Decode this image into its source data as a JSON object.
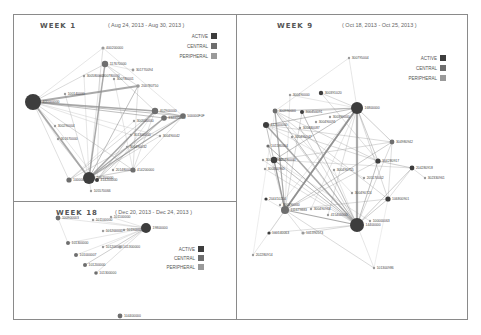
{
  "colors": {
    "active": "#3d3d3d",
    "central": "#6e6e6e",
    "peripheral": "#9a9a9a",
    "edge": "#8c8c8c"
  },
  "legend": [
    "ACTIVE",
    "CENTRAL",
    "PERIPHERAL"
  ],
  "panels": [
    {
      "id": "week1",
      "title": "WEEK 1",
      "range": "( Aug 24, 2013 - Aug 30, 2013 )",
      "nodes": [
        {
          "label": "400200000",
          "t": "peripheral"
        },
        {
          "label": "117670000",
          "t": "central"
        },
        {
          "label": "300580000",
          "t": "peripheral"
        },
        {
          "label": "300780000",
          "t": "peripheral"
        },
        {
          "label": "301770094",
          "t": "peripheral"
        },
        {
          "label": "300780001",
          "t": "peripheral"
        },
        {
          "label": "200780750",
          "t": "peripheral"
        },
        {
          "label": "100140000",
          "t": "peripheral"
        },
        {
          "label": "400000000",
          "t": "active"
        },
        {
          "label": "402900000",
          "t": "central"
        },
        {
          "label": "334000000",
          "t": "central"
        },
        {
          "label": "500000F0F",
          "t": "central"
        },
        {
          "label": "300290004",
          "t": "peripheral"
        },
        {
          "label": "300500000",
          "t": "peripheral"
        },
        {
          "label": "301670000",
          "t": "peripheral"
        },
        {
          "label": "301300000",
          "t": "peripheral"
        },
        {
          "label": "300490042",
          "t": "peripheral"
        },
        {
          "label": "300490032",
          "t": "peripheral"
        },
        {
          "label": "201480000",
          "t": "peripheral"
        },
        {
          "label": "414200000",
          "t": "central"
        },
        {
          "label": "100000000",
          "t": "central"
        },
        {
          "label": "200200000",
          "t": "active"
        },
        {
          "label": "414200000",
          "t": "active"
        },
        {
          "label": "105570066",
          "t": "peripheral"
        }
      ]
    },
    {
      "id": "week18",
      "title": "WEEK 18",
      "range": "( Dec 20, 2013 - Dec 24, 2013 )",
      "nodes": [
        {
          "label": "19800000",
          "t": "active"
        },
        {
          "label": "100900003",
          "t": "central"
        },
        {
          "label": "101100000",
          "t": "peripheral"
        },
        {
          "label": "101100000",
          "t": "peripheral"
        },
        {
          "label": "101200000",
          "t": "peripheral"
        },
        {
          "label": "101900007",
          "t": "peripheral"
        },
        {
          "label": "101300000",
          "t": "central"
        },
        {
          "label": "101200000",
          "t": "peripheral"
        },
        {
          "label": "101300000",
          "t": "peripheral"
        },
        {
          "label": "101000007",
          "t": "central"
        },
        {
          "label": "101200000",
          "t": "central"
        },
        {
          "label": "101300000",
          "t": "central"
        },
        {
          "label": "104400000",
          "t": "central"
        }
      ]
    },
    {
      "id": "week9",
      "title": "WEEK 9",
      "range": "( Oct 18, 2013 - Oct 25, 2013 )",
      "nodes": [
        {
          "label": "300795004",
          "t": "peripheral"
        },
        {
          "label": "300490000",
          "t": "peripheral"
        },
        {
          "label": "300391020",
          "t": "active"
        },
        {
          "label": "16800000",
          "t": "active"
        },
        {
          "label": "300990000",
          "t": "central"
        },
        {
          "label": "300450091",
          "t": "active"
        },
        {
          "label": "300390000",
          "t": "peripheral"
        },
        {
          "label": "300490091",
          "t": "peripheral"
        },
        {
          "label": "412500000",
          "t": "active"
        },
        {
          "label": "300480087",
          "t": "peripheral"
        },
        {
          "label": "300490047",
          "t": "peripheral"
        },
        {
          "label": "304980942",
          "t": "central"
        },
        {
          "label": "101180004",
          "t": "central"
        },
        {
          "label": "300490000",
          "t": "active"
        },
        {
          "label": "300490917",
          "t": "peripheral"
        },
        {
          "label": "300400960",
          "t": "peripheral"
        },
        {
          "label": "304280917",
          "t": "active"
        },
        {
          "label": "204280918",
          "t": "active"
        },
        {
          "label": "302330961",
          "t": "peripheral"
        },
        {
          "label": "300490755",
          "t": "peripheral"
        },
        {
          "label": "205170002",
          "t": "peripheral"
        },
        {
          "label": "300490724",
          "t": "peripheral"
        },
        {
          "label": "106800901",
          "t": "active"
        },
        {
          "label": "204410200",
          "t": "active"
        },
        {
          "label": "300490000",
          "t": "peripheral"
        },
        {
          "label": "111679883",
          "t": "central"
        },
        {
          "label": "300490964",
          "t": "peripheral"
        },
        {
          "label": "415400000",
          "t": "peripheral"
        },
        {
          "label": "14400000",
          "t": "active"
        },
        {
          "label": "100000063",
          "t": "peripheral"
        },
        {
          "label": "100140063",
          "t": "active"
        },
        {
          "label": "101390573",
          "t": "peripheral"
        },
        {
          "label": "202280914",
          "t": "peripheral"
        },
        {
          "label": "101300986",
          "t": "peripheral"
        }
      ]
    }
  ]
}
